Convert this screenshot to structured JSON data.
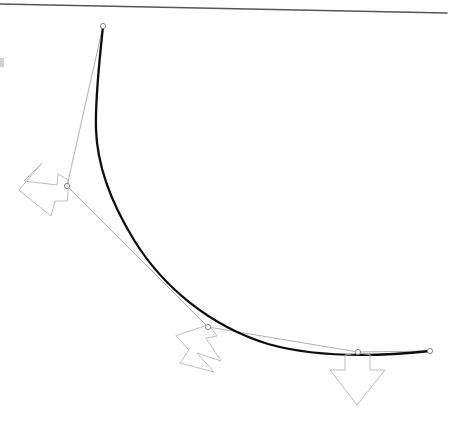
{
  "figure": {
    "background_color": "#ffffff",
    "width": 451,
    "height": 424,
    "colors": {
      "curve": "#0d0d0d",
      "chord": "#9a9a9a",
      "rule": "#55555a",
      "arrow_outline": "#b4b4b4",
      "node_stroke": "#7a7a7a",
      "node_fill": "#ffffff",
      "margin_mark": "#c9c9c9"
    }
  },
  "chart_data": {
    "type": "line",
    "xlabel": "",
    "ylabel": "",
    "xlim": [
      0,
      451
    ],
    "ylim": [
      424,
      0
    ],
    "grid": false,
    "legend": "none",
    "series": [
      {
        "name": "smooth-curve",
        "style": "thick-black-curve",
        "stroke": "#0d0d0d",
        "stroke_width": 2.3,
        "path": "M 103 26 C 100 58 95 96 96 129 C 97 163 110 201 134 240 C 163 287 210 326 268 344 C 318 358 382 356 430 351",
        "x": [
          103,
          96,
          134,
          268,
          430
        ],
        "y": [
          26,
          129,
          240,
          344,
          351
        ]
      },
      {
        "name": "control-polyline",
        "style": "thin-grey-chord",
        "stroke": "#9a9a9a",
        "stroke_width": 0.8,
        "x": [
          103,
          67,
          208,
          358,
          430
        ],
        "y": [
          26,
          186,
          327,
          352,
          351
        ]
      },
      {
        "name": "top-rule",
        "style": "straight-rule",
        "stroke": "#55555a",
        "stroke_width": 1.6,
        "x": [
          0,
          447
        ],
        "y": [
          4,
          13
        ]
      }
    ],
    "nodes": [
      {
        "label": "node-1",
        "x": 103,
        "y": 26,
        "radius": 2.6
      },
      {
        "label": "node-2",
        "x": 67,
        "y": 186,
        "radius": 2.6
      },
      {
        "label": "node-3",
        "x": 208,
        "y": 327,
        "radius": 2.6
      },
      {
        "label": "node-4",
        "x": 358,
        "y": 352,
        "radius": 2.6
      },
      {
        "label": "node-5",
        "x": 430,
        "y": 351,
        "radius": 2.6
      }
    ],
    "annotations": [
      {
        "label": "arrow-left",
        "direction": "left",
        "anchor_x": 67,
        "anchor_y": 186,
        "rotation_deg": 14,
        "path": "M 68 180 L 58 174 L 57 185 L 24 181 L 42 163 L 19 190 L 51 216 L 55 201 L 67 201 Z"
      },
      {
        "label": "arrow-down-left",
        "direction": "down-left",
        "anchor_x": 208,
        "anchor_y": 327,
        "rotation_deg": -18,
        "path": "M 209 325 L 217 336 L 206 338 L 221 361 L 197 353 L 214 372 L 180 363 L 189 350 L 176 336 Z"
      },
      {
        "label": "arrow-down",
        "direction": "down",
        "anchor_x": 358,
        "anchor_y": 352,
        "rotation_deg": 0,
        "path": "M 358 353 L 345 355 L 345 370 L 330 370 L 357 405 L 385 370 L 370 370 L 370 355 Z"
      }
    ],
    "margin_marks": [
      {
        "label": "left-edge-fragment",
        "x": 0,
        "y": 58,
        "width": 4,
        "height": 9
      }
    ]
  }
}
